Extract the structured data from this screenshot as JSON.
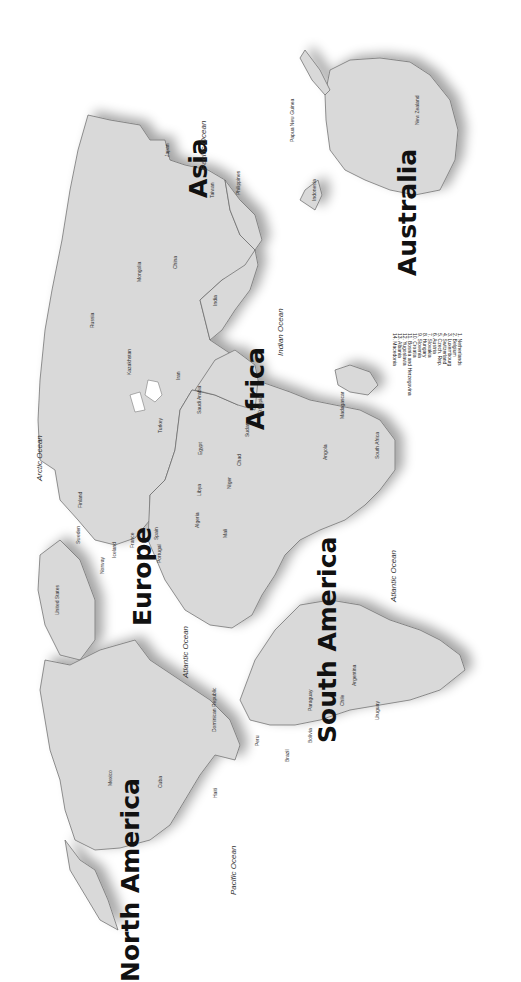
{
  "map": {
    "orientation": "rotated 90° clockwise (north to the left)",
    "colors": {
      "land": "#d9d9d9",
      "border": "#666666",
      "water": "#ffffff",
      "text": "#111111"
    },
    "continents": [
      "Asia",
      "Australia",
      "Africa",
      "Europe",
      "South America",
      "North America"
    ],
    "oceans": [
      "Pacific Ocean",
      "Arctic Ocean",
      "Indian Ocean",
      "Atlantic Ocean",
      "Atlantic Ocean",
      "Pacific Ocean"
    ],
    "countries": [
      "Japan",
      "North Korea",
      "South Korea",
      "Taiwan",
      "Philippines",
      "Papua New Guinea",
      "New Zealand",
      "Indonesia",
      "Borneo",
      "Brunei",
      "Malaysia",
      "Cambodia",
      "Vietnam",
      "Thailand",
      "Myanmar",
      "China",
      "Mongolia",
      "Russia",
      "Kazakhstan",
      "India",
      "Bangladesh",
      "Bhutan",
      "Nepal",
      "Pakistan",
      "Afghanistan",
      "Iran",
      "Iraq",
      "Syria",
      "Jordan",
      "Saudi Arabia",
      "Kuwait",
      "Qatar",
      "U.A.E.",
      "Oman",
      "Yemen",
      "Turkey",
      "Greece",
      "Egypt",
      "Libya",
      "Sudan",
      "Ethiopia",
      "Eritrea",
      "Chad",
      "Niger",
      "Mali",
      "Nigeria",
      "Algeria",
      "Morocco",
      "Mauritania",
      "Senegal",
      "Gambia",
      "Guinea Bissau",
      "Guinea",
      "Sierra Leone",
      "Liberia",
      "Togo",
      "Ghana",
      "Cameroon",
      "Gabon",
      "Cabinda (Angola)",
      "Central African Rep.",
      "Democratic Republic of the Congo",
      "Uganda",
      "Kenya",
      "Rwanda",
      "Burundi",
      "Tanzania",
      "Malawi",
      "Mozambique",
      "Zambia",
      "Zimbabwe",
      "Angola",
      "Namibia",
      "Botswana",
      "South Africa",
      "Swaziland",
      "Lesotho",
      "Madagascar",
      "Spain",
      "Portugal",
      "France",
      "Italy",
      "Germany",
      "Poland",
      "Ireland",
      "United Kingdom",
      "Iceland",
      "Norway",
      "Sweden",
      "Finland",
      "Greenland",
      "Canada",
      "United States",
      "Mexico",
      "Cuba",
      "Haiti",
      "Dominican Republic",
      "Puerto Rico",
      "Jamaica",
      "Belize",
      "Honduras",
      "Nicaragua",
      "Guatemala",
      "El Salvador",
      "Costa Rica",
      "Panama",
      "Venezuela",
      "Guyana",
      "Suriname",
      "French Guiana",
      "Colombia",
      "Ecuador",
      "Peru",
      "Brazil",
      "Bolivia",
      "Paraguay",
      "Chile",
      "Argentina",
      "Uruguay"
    ],
    "legend": [
      "1. Netherlands",
      "2. Belgium",
      "3. Luxembourg",
      "4. Switzerland",
      "5. Czech. Rep.",
      "6. Austria",
      "7. Slovakia",
      "8. Hungary",
      "9. Slovenia",
      "10. Croatia",
      "11. Bosnia and Herzegovina",
      "12. Yugoslavia",
      "13. Albania",
      "14. Macedonia"
    ]
  }
}
